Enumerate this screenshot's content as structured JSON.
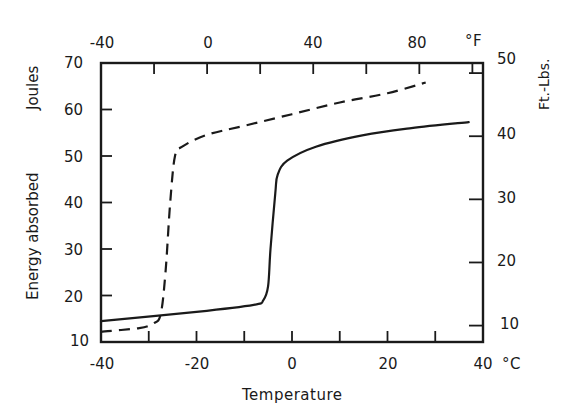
{
  "chart_data": {
    "type": "line",
    "title": "",
    "xlabel": "Temperature",
    "ylabel": "Energy absorbed",
    "ylabel_unit": "Joules",
    "y2label": "Ft.-Lbs.",
    "x_unit": "°C",
    "x2_unit": "°F",
    "xlim": [
      -40,
      40
    ],
    "ylim": [
      10,
      70
    ],
    "y2lim": [
      7.4,
      51.6
    ],
    "grid": false,
    "legend": null,
    "x_ticks": [
      -40,
      -30,
      -20,
      -10,
      0,
      10,
      20,
      30,
      40
    ],
    "x_tick_labels": [
      "-40",
      "-20",
      "0",
      "20",
      "40"
    ],
    "x2_ticks_F": [
      -40,
      -20,
      0,
      20,
      40,
      60,
      80,
      100
    ],
    "x2_tick_labels": [
      "-40",
      "0",
      "40",
      "80"
    ],
    "y_ticks": [
      10,
      20,
      30,
      40,
      50,
      60,
      70
    ],
    "y_tick_labels": [
      "10",
      "20",
      "30",
      "40",
      "50",
      "60",
      "70"
    ],
    "y2_ticks": [
      10,
      20,
      30,
      40,
      50
    ],
    "y2_tick_labels": [
      "10",
      "20",
      "30",
      "40",
      "50"
    ],
    "series": [
      {
        "name": "solid",
        "style": "solid",
        "x": [
          -40,
          -20,
          -8,
          -6,
          -5,
          -4.5,
          -3.5,
          -3,
          -1,
          5,
          15,
          25,
          37
        ],
        "y": [
          14.5,
          16.5,
          18,
          19,
          22,
          30,
          42,
          46,
          49,
          52,
          54.5,
          56,
          57.3
        ]
      },
      {
        "name": "dashed",
        "style": "dashed",
        "x": [
          -40,
          -32,
          -29,
          -27.5,
          -26.5,
          -25.5,
          -24.5,
          -23,
          -18,
          -10,
          0,
          10,
          20,
          28
        ],
        "y": [
          12.2,
          13,
          14,
          16,
          25,
          40,
          50,
          52,
          54.5,
          56.5,
          59,
          61.5,
          63.5,
          65.8
        ]
      }
    ]
  },
  "labels": {
    "x_axis_title": "Temperature",
    "y_axis_title": "Energy absorbed",
    "y_axis_unit": "Joules",
    "y2_axis_title": "Ft.-Lbs.",
    "x_unit": "°C",
    "x2_unit": "°F",
    "x_ticks": [
      "-40",
      "-20",
      "0",
      "20",
      "40"
    ],
    "x2_ticks": [
      "-40",
      "0",
      "40",
      "80"
    ],
    "y_ticks": [
      "70",
      "60",
      "50",
      "40",
      "30",
      "20",
      "10"
    ],
    "y2_ticks": [
      "50",
      "40",
      "30",
      "20",
      "10"
    ]
  }
}
